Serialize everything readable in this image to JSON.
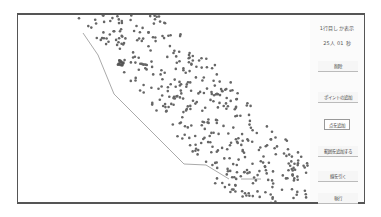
{
  "panel": {
    "info_line1": "1行目しか表示",
    "info_line2": "25人 01 秒",
    "buttons": [
      {
        "label": "削除",
        "top": 46
      },
      {
        "label": "ポイントの追加",
        "top": 77
      },
      {
        "label": "点を追加",
        "top": 104
      },
      {
        "label": "範囲を追加する",
        "top": 131
      },
      {
        "label": "線を引く",
        "top": 156
      },
      {
        "label": "執行",
        "top": 178
      }
    ]
  },
  "plot": {
    "point_color": "#666666",
    "line_color": "#aaaaaa",
    "boundary_line": [
      [
        65,
        18
      ],
      [
        80,
        40
      ],
      [
        96,
        79
      ],
      [
        166,
        149
      ],
      [
        188,
        150
      ],
      [
        211,
        164
      ]
    ],
    "boundary_line2": [
      [
        223,
        164
      ],
      [
        243,
        164
      ]
    ],
    "point_count": 430
  }
}
